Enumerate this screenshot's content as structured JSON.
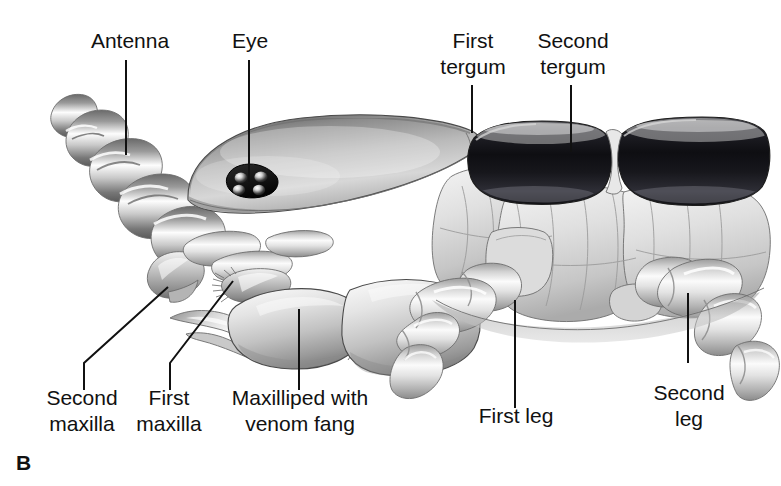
{
  "figure": {
    "panel_letter": "B",
    "background_color": "#ffffff",
    "ink_color": "#111111"
  },
  "labels": [
    {
      "id": "antenna",
      "text": "Antenna",
      "lines": [
        "Antenna"
      ],
      "text_x": 130,
      "text_y": 48,
      "leader": "M 126 60 L 126 155",
      "position": "top-left"
    },
    {
      "id": "eye",
      "text": "Eye",
      "lines": [
        "Eye"
      ],
      "text_x": 250,
      "text_y": 48,
      "leader": "M 249 60 L 249 182",
      "position": "top-left-center"
    },
    {
      "id": "first-tergum",
      "text": "First tergum",
      "lines": [
        "First",
        "tergum"
      ],
      "text_x": 473,
      "text_y": 48,
      "leader": "M 472 85 L 472 133",
      "position": "top-center-right"
    },
    {
      "id": "second-tergum",
      "text": "Second tergum",
      "lines": [
        "Second",
        "tergum"
      ],
      "text_x": 573,
      "text_y": 48,
      "leader": "M 571 85 L 571 152",
      "position": "top-right"
    },
    {
      "id": "second-maxilla",
      "text": "Second maxilla",
      "lines": [
        "Second",
        "maxilla"
      ],
      "text_x": 82,
      "text_y": 405,
      "leader": "M 84 390 L 84 363 L 168 287",
      "position": "bottom-left"
    },
    {
      "id": "first-maxilla",
      "text": "First maxilla",
      "lines": [
        "First",
        "maxilla"
      ],
      "text_x": 169,
      "text_y": 405,
      "leader": "M 170 390 L 170 363 L 233 281",
      "position": "bottom-left-center"
    },
    {
      "id": "maxilliped-with-venom-fang",
      "text": "Maxilliped with venom fang",
      "lines": [
        "Maxilliped with",
        "venom fang"
      ],
      "text_x": 300,
      "text_y": 405,
      "leader": "M 299 390 L 299 309",
      "position": "bottom-center"
    },
    {
      "id": "first-leg",
      "text": "First leg",
      "lines": [
        "First leg"
      ],
      "text_x": 516,
      "text_y": 423,
      "leader": "M 515 408 L 515 300",
      "position": "bottom-center-right"
    },
    {
      "id": "second-leg",
      "text": "Second leg",
      "lines": [
        "Second",
        "leg"
      ],
      "text_x": 689,
      "text_y": 400,
      "leader": "M 688 363 L 688 293",
      "position": "bottom-right"
    }
  ],
  "anatomy": {
    "antenna": {
      "name": "antenna",
      "segment_count": 5,
      "description": "tapering ringed segments curving up and to the left"
    },
    "eye": {
      "name": "eye",
      "ocelli_count": 4,
      "description": "dark cluster of four ocelli on the side of the head"
    },
    "head": {
      "name": "head-capsule",
      "description": "large smooth rounded head shield"
    },
    "terga": [
      {
        "name": "first-tergum",
        "order": 1,
        "tone": "dark"
      },
      {
        "name": "second-tergum",
        "order": 2,
        "tone": "dark"
      }
    ],
    "mouthparts": [
      {
        "name": "second-maxilla",
        "order": 2
      },
      {
        "name": "first-maxilla",
        "order": 1
      },
      {
        "name": "maxilliped",
        "feature": "venom-fang"
      }
    ],
    "legs": [
      {
        "name": "first-leg",
        "order": 1
      },
      {
        "name": "second-leg",
        "order": 2
      }
    ]
  },
  "palette": {
    "background": "#ffffff",
    "ink": "#111111",
    "tergum_dark": "#15151a",
    "tergum_mid": "#3a3a42",
    "body_light": "#e6e6e6",
    "body_mid": "#b8b8b8",
    "body_shadow": "#7d7d7d",
    "highlight": "#fbfbfb",
    "outline": "#4a4a4a"
  }
}
